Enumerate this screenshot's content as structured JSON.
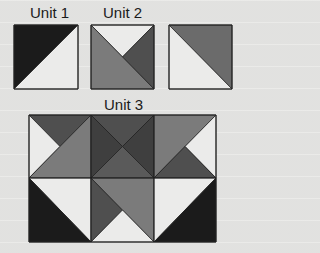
{
  "labels": {
    "unit1": "Unit 1",
    "unit2": "Unit 2",
    "unit3": "Unit 3"
  },
  "colors": {
    "black": "#1b1b1b",
    "dark": "#4f4f4f",
    "medium": "#7b7b7b",
    "light": "#ebebea",
    "outline": "#222222"
  },
  "units": [
    {
      "name": "Unit 1",
      "pattern": "half-square triangle: top-left black, bottom-right light"
    },
    {
      "name": "Unit 2",
      "pattern": "quarter-square: top light, right dark, bottom-left half medium"
    },
    {
      "name": "Unit (unlabeled)",
      "pattern": "half-square triangle: top-right medium, bottom-left light"
    },
    {
      "name": "Unit 3",
      "pattern": "3x2 grid composed of Unit 1, Unit 2 and triangle units"
    }
  ]
}
